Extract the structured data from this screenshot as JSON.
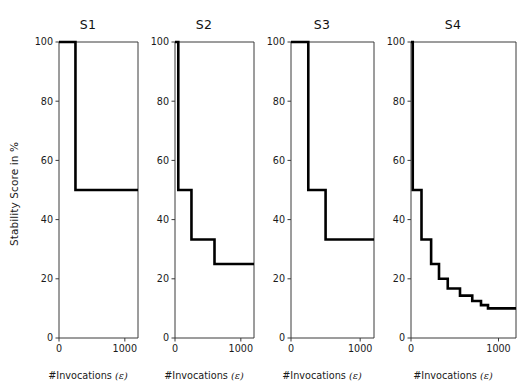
{
  "figure": {
    "ylabel": "Stability Score in %",
    "xlabel_prefix": "#Invocations",
    "xlabel_symbol": "(ε)",
    "background": "#ffffff",
    "line_color": "#000000",
    "axis_color": "#3a3a3a"
  },
  "chart_data": {
    "type": "line",
    "title": "",
    "subtitle": "",
    "xlabel": "#Invocations (ε)",
    "ylabel": "Stability Score in %",
    "xlim": [
      0,
      1200
    ],
    "ylim": [
      0,
      100
    ],
    "xticks": [
      0,
      1000
    ],
    "xticklabels": [
      "0",
      "1000"
    ],
    "yticks": [
      0,
      20,
      40,
      60,
      80,
      100
    ],
    "yticklabels": [
      "0",
      "20",
      "40",
      "60",
      "80",
      "100"
    ],
    "grid": false,
    "legend": "none",
    "drawstyle": "steps-post",
    "panels": [
      {
        "title": "S1",
        "x": [
          0,
          250,
          250,
          1200
        ],
        "y": [
          100,
          100,
          50,
          50
        ],
        "steps": [
          {
            "x_start": 0,
            "x_end": 250,
            "value": 100
          },
          {
            "x_start": 250,
            "x_end": 1200,
            "value": 50
          }
        ]
      },
      {
        "title": "S2",
        "x": [
          0,
          50,
          50,
          250,
          250,
          600,
          600,
          1200
        ],
        "y": [
          100,
          100,
          50,
          50,
          33.3,
          33.3,
          25,
          25
        ],
        "steps": [
          {
            "x_start": 0,
            "x_end": 50,
            "value": 100
          },
          {
            "x_start": 50,
            "x_end": 250,
            "value": 50
          },
          {
            "x_start": 250,
            "x_end": 600,
            "value": 33.3
          },
          {
            "x_start": 600,
            "x_end": 1200,
            "value": 25
          }
        ]
      },
      {
        "title": "S3",
        "x": [
          0,
          250,
          250,
          500,
          500,
          1200
        ],
        "y": [
          100,
          100,
          50,
          50,
          33.3,
          33.3
        ],
        "steps": [
          {
            "x_start": 0,
            "x_end": 250,
            "value": 100
          },
          {
            "x_start": 250,
            "x_end": 500,
            "value": 50
          },
          {
            "x_start": 500,
            "x_end": 1200,
            "value": 33.3
          }
        ]
      },
      {
        "title": "S4",
        "x": [
          0,
          20,
          20,
          120,
          120,
          230,
          230,
          320,
          320,
          420,
          420,
          560,
          560,
          700,
          700,
          800,
          800,
          880,
          880,
          1200
        ],
        "y": [
          100,
          100,
          50,
          50,
          33.3,
          33.3,
          25,
          25,
          20,
          20,
          16.7,
          16.7,
          14.3,
          14.3,
          12.5,
          12.5,
          11.1,
          11.1,
          10,
          10
        ],
        "steps": [
          {
            "x_start": 0,
            "x_end": 20,
            "value": 100
          },
          {
            "x_start": 20,
            "x_end": 120,
            "value": 50
          },
          {
            "x_start": 120,
            "x_end": 230,
            "value": 33.3
          },
          {
            "x_start": 230,
            "x_end": 320,
            "value": 25
          },
          {
            "x_start": 320,
            "x_end": 420,
            "value": 20
          },
          {
            "x_start": 420,
            "x_end": 560,
            "value": 16.7
          },
          {
            "x_start": 560,
            "x_end": 700,
            "value": 14.3
          },
          {
            "x_start": 700,
            "x_end": 800,
            "value": 12.5
          },
          {
            "x_start": 800,
            "x_end": 880,
            "value": 11.1
          },
          {
            "x_start": 880,
            "x_end": 1200,
            "value": 10
          }
        ]
      }
    ]
  },
  "layout": {
    "panel_lefts": [
      30,
      146,
      262,
      382
    ],
    "panel_widths": [
      116,
      116,
      120,
      142
    ],
    "axis_left_offset": 29,
    "axis_right_margin": 8,
    "plot_top": 42,
    "plot_bottom": 338
  }
}
